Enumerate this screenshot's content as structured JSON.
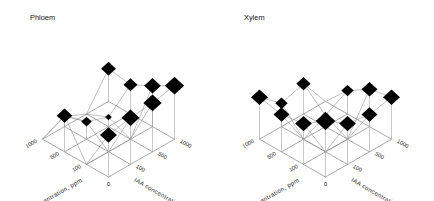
{
  "figure": {
    "kind": "two 3-D lattice marker plots",
    "background": "#ffffff",
    "marker_color": "#000000",
    "mesh_color": "#8c8c8c"
  },
  "panels": [
    {
      "id": "phloem",
      "title": "Phloem"
    },
    {
      "id": "xylem",
      "title": "Xylem"
    }
  ],
  "axes": {
    "left": {
      "label": "GA  concentration,  ppm",
      "ticks": [
        "1000",
        "500",
        "100",
        "0"
      ]
    },
    "right": {
      "label": "IAA  concentration,  ppm",
      "ticks": [
        "0",
        "100",
        "500",
        "1000"
      ]
    }
  },
  "chart_data": [
    {
      "type": "scatter",
      "title": "Phloem",
      "xlabel": "IAA concentration, ppm",
      "ylabel": "GA concentration, ppm",
      "zlabel": "response (marker area)",
      "x": [
        0,
        100,
        500,
        1000
      ],
      "y": [
        0,
        100,
        500,
        1000
      ],
      "encoding": "diamond marker area proportional to value",
      "grid": true,
      "legend": "none",
      "values": [
        {
          "ga": 0,
          "iaa": 0,
          "size": 62
        },
        {
          "ga": 0,
          "iaa": 100,
          "size": 70
        },
        {
          "ga": 0,
          "iaa": 500,
          "size": 74
        },
        {
          "ga": 0,
          "iaa": 1000,
          "size": 82
        },
        {
          "ga": 100,
          "iaa": 0,
          "size": 0
        },
        {
          "ga": 100,
          "iaa": 100,
          "size": 0
        },
        {
          "ga": 100,
          "iaa": 500,
          "size": 0
        },
        {
          "ga": 100,
          "iaa": 1000,
          "size": 60
        },
        {
          "ga": 500,
          "iaa": 0,
          "size": 52
        },
        {
          "ga": 500,
          "iaa": 100,
          "size": 20
        },
        {
          "ga": 500,
          "iaa": 500,
          "size": 6
        },
        {
          "ga": 500,
          "iaa": 1000,
          "size": 40
        },
        {
          "ga": 1000,
          "iaa": 0,
          "size": 0
        },
        {
          "ga": 1000,
          "iaa": 100,
          "size": 7
        },
        {
          "ga": 1000,
          "iaa": 500,
          "size": 0
        },
        {
          "ga": 1000,
          "iaa": 1000,
          "size": 46
        }
      ]
    },
    {
      "type": "scatter",
      "title": "Xylem",
      "xlabel": "IAA concentration, ppm",
      "ylabel": "GA concentration, ppm",
      "zlabel": "response (marker area)",
      "x": [
        0,
        100,
        500,
        1000
      ],
      "y": [
        0,
        100,
        500,
        1000
      ],
      "encoding": "diamond marker area proportional to value",
      "grid": true,
      "legend": "none",
      "values": [
        {
          "ga": 0,
          "iaa": 0,
          "size": 86
        },
        {
          "ga": 0,
          "iaa": 100,
          "size": 60
        },
        {
          "ga": 0,
          "iaa": 500,
          "size": 54
        },
        {
          "ga": 0,
          "iaa": 1000,
          "size": 62
        },
        {
          "ga": 100,
          "iaa": 0,
          "size": 60
        },
        {
          "ga": 100,
          "iaa": 100,
          "size": 0
        },
        {
          "ga": 100,
          "iaa": 500,
          "size": 0
        },
        {
          "ga": 100,
          "iaa": 1000,
          "size": 54
        },
        {
          "ga": 500,
          "iaa": 0,
          "size": 54
        },
        {
          "ga": 500,
          "iaa": 100,
          "size": 0
        },
        {
          "ga": 500,
          "iaa": 500,
          "size": 9
        },
        {
          "ga": 500,
          "iaa": 1000,
          "size": 30
        },
        {
          "ga": 1000,
          "iaa": 0,
          "size": 62
        },
        {
          "ga": 1000,
          "iaa": 100,
          "size": 30
        },
        {
          "ga": 1000,
          "iaa": 500,
          "size": 42
        },
        {
          "ga": 1000,
          "iaa": 1000,
          "size": 0
        }
      ]
    }
  ]
}
